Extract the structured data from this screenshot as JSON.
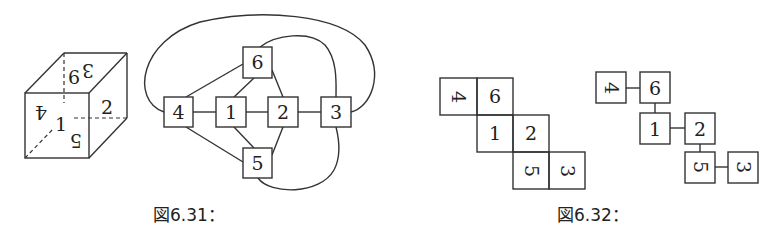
{
  "figures": [
    {
      "id": "fig-6-31",
      "caption": "図6.31：",
      "cube": {
        "faces": [
          {
            "label": "1",
            "position": "front-center",
            "rotation": 0
          },
          {
            "label": "2",
            "position": "right",
            "rotation": 0
          },
          {
            "label": "4",
            "position": "front-upper-left",
            "rotation": 180
          },
          {
            "label": "5",
            "position": "front-lower-right",
            "rotation": 180
          },
          {
            "label": "6",
            "position": "top-left",
            "rotation": 0
          },
          {
            "label": "3",
            "position": "top-right",
            "rotation": 180
          }
        ]
      },
      "graph": {
        "nodes": [
          "1",
          "2",
          "3",
          "4",
          "5",
          "6"
        ],
        "edges": [
          [
            "4",
            "1"
          ],
          [
            "1",
            "2"
          ],
          [
            "2",
            "3"
          ],
          [
            "4",
            "6"
          ],
          [
            "1",
            "6"
          ],
          [
            "6",
            "2"
          ],
          [
            "4",
            "5"
          ],
          [
            "1",
            "5"
          ],
          [
            "5",
            "2"
          ],
          [
            "4",
            "3"
          ],
          [
            "6",
            "3"
          ],
          [
            "5",
            "3"
          ]
        ]
      }
    },
    {
      "id": "fig-6-32",
      "caption": "図6.32：",
      "net": {
        "cells": [
          {
            "label": "4",
            "row": 0,
            "col": 0,
            "rotation": 90
          },
          {
            "label": "6",
            "row": 0,
            "col": 1,
            "rotation": 0
          },
          {
            "label": "1",
            "row": 1,
            "col": 1,
            "rotation": 0
          },
          {
            "label": "2",
            "row": 1,
            "col": 2,
            "rotation": 0
          },
          {
            "label": "5",
            "row": 2,
            "col": 2,
            "rotation": 90
          },
          {
            "label": "3",
            "row": 2,
            "col": 3,
            "rotation": 90
          }
        ]
      },
      "tree": {
        "nodes": [
          "4",
          "6",
          "1",
          "2",
          "5",
          "3"
        ],
        "edges": [
          [
            "4",
            "6"
          ],
          [
            "6",
            "1"
          ],
          [
            "1",
            "2"
          ],
          [
            "2",
            "5"
          ],
          [
            "5",
            "3"
          ]
        ]
      }
    }
  ]
}
